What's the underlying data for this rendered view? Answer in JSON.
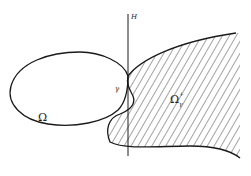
{
  "figure": {
    "labels": {
      "hyperplane": "H",
      "curve": "γ",
      "domain": "Ω",
      "region_base": "Ω",
      "region_sup": "+",
      "region_sub": "γ"
    },
    "colors": {
      "stroke": "#1a1a1a",
      "hatch": "#333333",
      "background": "#ffffff"
    }
  }
}
